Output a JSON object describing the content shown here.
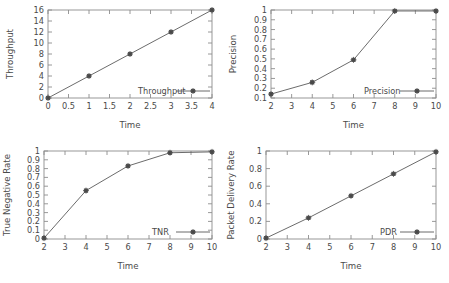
{
  "figure": {
    "background": "#ffffff",
    "line_color": "#5a5a5a",
    "axis_color": "#8d8d8d",
    "text_color": "#4a4a4a",
    "panel_count": 4
  },
  "chart_data": [
    {
      "id": "throughput",
      "type": "line",
      "title": "",
      "xlabel": "Time",
      "ylabel": "Throughput",
      "legend": "Throughput",
      "legend_position": "bottom-right-inside",
      "grid": false,
      "xlim": [
        0,
        4
      ],
      "ylim": [
        0,
        16
      ],
      "xticks": [
        0,
        0.5,
        1,
        1.5,
        2,
        2.5,
        3,
        3.5,
        4
      ],
      "xticklabels": [
        "0",
        "0.5",
        "1",
        "1.5",
        "2",
        "2.5",
        "3",
        "3.5",
        "4"
      ],
      "yticks": [
        0,
        2,
        4,
        6,
        8,
        10,
        12,
        14,
        16
      ],
      "yticklabels": [
        "0",
        "2",
        "4",
        "6",
        "8",
        "10",
        "12",
        "14",
        "16"
      ],
      "x": [
        0,
        1,
        2,
        3,
        4
      ],
      "values": [
        0,
        4,
        8,
        12,
        16
      ]
    },
    {
      "id": "precision",
      "type": "line",
      "title": "",
      "xlabel": "Time",
      "ylabel": "Precision",
      "legend": "Precision",
      "legend_position": "bottom-right-inside",
      "grid": false,
      "xlim": [
        2,
        10
      ],
      "ylim": [
        0.1,
        1
      ],
      "xticks": [
        2,
        3,
        4,
        5,
        6,
        7,
        8,
        9,
        10
      ],
      "xticklabels": [
        "2",
        "3",
        "4",
        "5",
        "6",
        "7",
        "8",
        "9",
        "10"
      ],
      "yticks": [
        0.1,
        0.2,
        0.3,
        0.4,
        0.5,
        0.6,
        0.7,
        0.8,
        0.9,
        1
      ],
      "yticklabels": [
        "0.1",
        "0.2",
        "0.3",
        "0.4",
        "0.5",
        "0.6",
        "0.7",
        "0.8",
        "0.9",
        "1"
      ],
      "x": [
        2,
        4,
        6,
        8,
        10
      ],
      "values": [
        0.14,
        0.26,
        0.49,
        0.99,
        0.99
      ]
    },
    {
      "id": "tnr",
      "type": "line",
      "title": "",
      "xlabel": "Time",
      "ylabel": "True Negative Rate",
      "legend": "TNR",
      "legend_position": "bottom-right-inside",
      "grid": false,
      "xlim": [
        2,
        10
      ],
      "ylim": [
        0,
        1
      ],
      "xticks": [
        2,
        3,
        4,
        5,
        6,
        7,
        8,
        9,
        10
      ],
      "xticklabels": [
        "2",
        "3",
        "4",
        "5",
        "6",
        "7",
        "8",
        "9",
        "10"
      ],
      "yticks": [
        0,
        0.1,
        0.2,
        0.3,
        0.4,
        0.5,
        0.6,
        0.7,
        0.8,
        0.9,
        1
      ],
      "yticklabels": [
        "0",
        "0.1",
        "0.2",
        "0.3",
        "0.4",
        "0.5",
        "0.6",
        "0.7",
        "0.8",
        "0.9",
        "1"
      ],
      "x": [
        2,
        4,
        6,
        8,
        10
      ],
      "values": [
        0.01,
        0.55,
        0.83,
        0.98,
        0.99
      ]
    },
    {
      "id": "pdr",
      "type": "line",
      "title": "",
      "xlabel": "Time",
      "ylabel": "Packet Delivery Rate",
      "legend": "PDR",
      "legend_position": "bottom-right-inside",
      "grid": false,
      "xlim": [
        2,
        10
      ],
      "ylim": [
        0,
        1
      ],
      "xticks": [
        2,
        3,
        4,
        5,
        6,
        7,
        8,
        9,
        10
      ],
      "xticklabels": [
        "2",
        "3",
        "4",
        "5",
        "6",
        "7",
        "8",
        "9",
        "10"
      ],
      "yticks": [
        0,
        0.2,
        0.4,
        0.6,
        0.8,
        1
      ],
      "yticklabels": [
        "0",
        "0.2",
        "0.4",
        "0.6",
        "0.8",
        "1"
      ],
      "x": [
        2,
        4,
        6,
        8,
        10
      ],
      "values": [
        0.01,
        0.24,
        0.49,
        0.74,
        0.99
      ]
    }
  ]
}
